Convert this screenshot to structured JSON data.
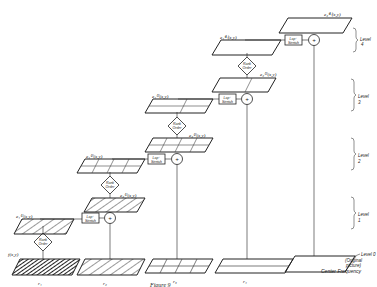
{
  "figure": {
    "caption": "Figure 9",
    "columns": [
      {
        "id": "r1",
        "label": "r₁"
      },
      {
        "id": "r2",
        "label": "r₂"
      },
      {
        "id": "r3",
        "label": "r₃"
      },
      {
        "id": "r4",
        "label": "r₄"
      },
      {
        "id": "r5",
        "label": ""
      }
    ],
    "bottom_label": {
      "line1": "Level 0",
      "line2": "(Original",
      "line3": "picture)",
      "line4": "Center Frequency"
    },
    "levels": [
      {
        "label": "Level",
        "num": "1"
      },
      {
        "label": "Level",
        "num": "2"
      },
      {
        "label": "Level",
        "num": "3"
      },
      {
        "label": "Level",
        "num": "4"
      }
    ],
    "plane_labels": {
      "f": "f(x,y)",
      "e1": "e₁⁽¹⁾(x,y)",
      "e2": "e₂⁽¹⁾(x,y)",
      "e1b": "e₁⁽²⁾(x,y)",
      "e2b": "e₂⁽²⁾(x,y)",
      "e1c": "e₁⁽³⁾(x,y)",
      "e2c": "e₂⁽³⁾(x,y)",
      "e1d": "e₁⁽⁴⁾(x,y)",
      "e2d": "e₂⁽⁴⁾(x,y)"
    },
    "blocks": {
      "rank_line1": "Rank",
      "rank_line2": "Order",
      "lap1": "Lap⁺",
      "lap2": "Stretch",
      "sum": "+"
    }
  }
}
